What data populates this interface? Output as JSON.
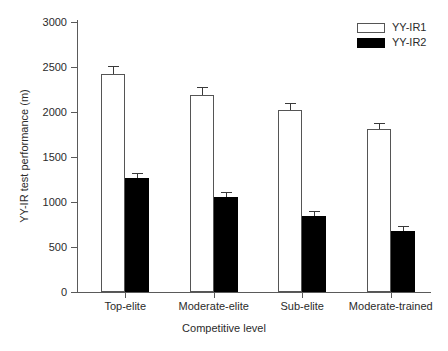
{
  "chart_data": {
    "type": "bar",
    "title": "",
    "xlabel": "Competitive level",
    "ylabel": "YY-IR test performance (m)",
    "categories": [
      "Top-elite",
      "Moderate-elite",
      "Sub-elite",
      "Moderate-trained"
    ],
    "ylim": [
      0,
      3000
    ],
    "yticks": [
      0,
      500,
      1000,
      1500,
      2000,
      2500,
      3000
    ],
    "ytick_labels": [
      "0",
      "500",
      "1000",
      "1500",
      "2000",
      "2500",
      "3000"
    ],
    "grid": false,
    "legend_position": "top-right",
    "series": [
      {
        "name": "YY-IR1",
        "color": "#ffffff",
        "edge_color": "#555555",
        "values": [
          2420,
          2190,
          2025,
          1810
        ],
        "errors": [
          95,
          85,
          80,
          70
        ]
      },
      {
        "name": "YY-IR2",
        "color": "#000000",
        "edge_color": "#000000",
        "values": [
          1265,
          1055,
          845,
          675
        ],
        "errors": [
          55,
          60,
          60,
          55
        ]
      }
    ]
  },
  "legend": {
    "items": [
      {
        "label": "YY-IR1",
        "swatch": "light"
      },
      {
        "label": "YY-IR2",
        "swatch": "dark"
      }
    ]
  },
  "axes": {
    "y_title": "YY-IR test performance (m)",
    "x_title": "Competitive level"
  }
}
